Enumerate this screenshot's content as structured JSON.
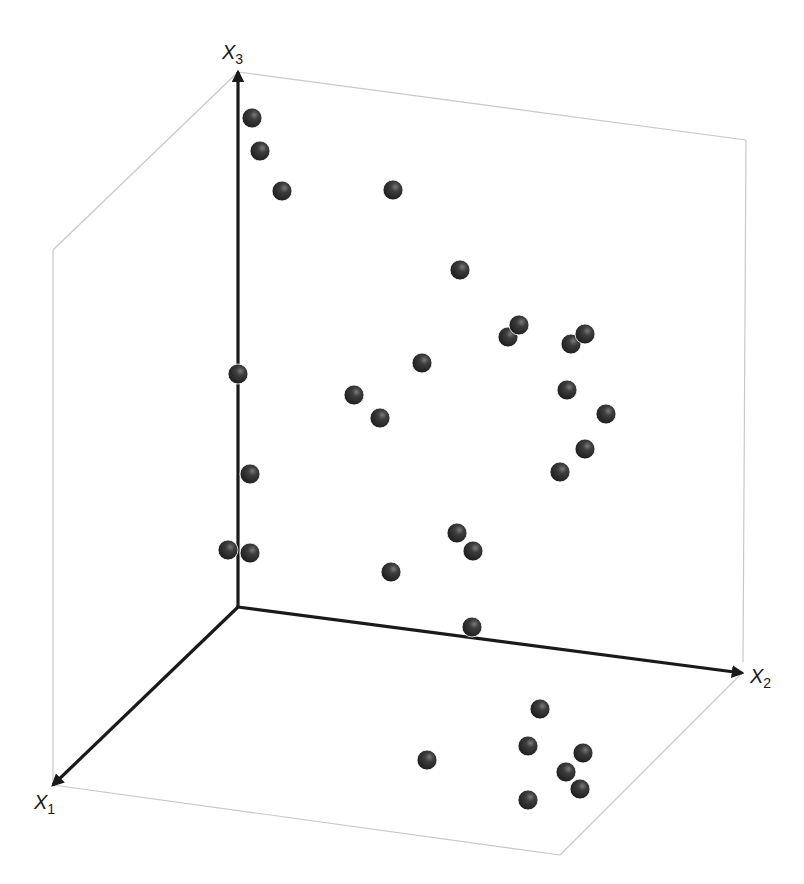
{
  "chart_data": {
    "type": "scatter",
    "subtype": "3d-scatter",
    "title": "",
    "axes": {
      "x1": {
        "label": "X",
        "subscript": "1"
      },
      "x2": {
        "label": "X",
        "subscript": "2"
      },
      "x3": {
        "label": "X",
        "subscript": "3"
      }
    },
    "grid": false,
    "legend": null,
    "marker": {
      "shape": "sphere",
      "color": "#333333",
      "radius_px": 10
    },
    "projection": {
      "origin": [
        238,
        607
      ],
      "x1_tip": [
        53,
        785
      ],
      "x2_tip": [
        742,
        673
      ],
      "x3_tip": [
        238,
        72
      ]
    },
    "box_edges": [
      [
        [
          238,
          72
        ],
        [
          746,
          140
        ]
      ],
      [
        [
          746,
          140
        ],
        [
          743,
          662
        ]
      ],
      [
        [
          238,
          72
        ],
        [
          53,
          250
        ]
      ],
      [
        [
          53,
          250
        ],
        [
          53,
          785
        ]
      ],
      [
        [
          53,
          785
        ],
        [
          560,
          855
        ]
      ],
      [
        [
          560,
          855
        ],
        [
          740,
          675
        ]
      ]
    ],
    "points_screen": [
      [
        252,
        118
      ],
      [
        260,
        151
      ],
      [
        282,
        191
      ],
      [
        393,
        190
      ],
      [
        460,
        270
      ],
      [
        508,
        337
      ],
      [
        519,
        325
      ],
      [
        571,
        344
      ],
      [
        585,
        334
      ],
      [
        238,
        374
      ],
      [
        354,
        395
      ],
      [
        380,
        418
      ],
      [
        422,
        363
      ],
      [
        567,
        390
      ],
      [
        606,
        414
      ],
      [
        585,
        449
      ],
      [
        560,
        472
      ],
      [
        250,
        474
      ],
      [
        228,
        550
      ],
      [
        250,
        553
      ],
      [
        391,
        572
      ],
      [
        457,
        533
      ],
      [
        473,
        551
      ],
      [
        472,
        627
      ],
      [
        427,
        760
      ],
      [
        540,
        709
      ],
      [
        528,
        746
      ],
      [
        583,
        753
      ],
      [
        566,
        772
      ],
      [
        580,
        789
      ],
      [
        528,
        800
      ]
    ],
    "point_count": 31
  },
  "labels": {
    "x1": {
      "main": "X",
      "sub": "1"
    },
    "x2": {
      "main": "X",
      "sub": "2"
    },
    "x3": {
      "main": "X",
      "sub": "3"
    }
  }
}
